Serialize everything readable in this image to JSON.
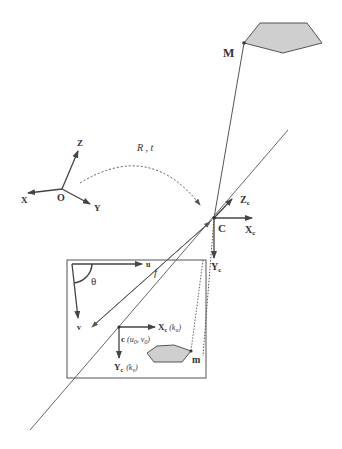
{
  "diagram": {
    "type": "pinhole-camera-model",
    "world_frame": {
      "origin_label": "O",
      "axes": [
        "X",
        "Y",
        "Z"
      ]
    },
    "transform_label": "R , t",
    "camera_center": {
      "label": "C",
      "axes": {
        "x": "X",
        "x_sub": "c",
        "y": "Y",
        "y_sub": "c",
        "z": "Z",
        "z_sub": "c"
      }
    },
    "world_point": {
      "label": "M"
    },
    "image_point": {
      "label": "m"
    },
    "focal_label": "f",
    "image_plane": {
      "u_label": "u",
      "v_label": "v",
      "skew_label": "θ",
      "principal_point_label": "c",
      "principal_point_coords": "(u",
      "u0_sub": "0",
      "comma": ", v",
      "v0_sub": "0",
      "close": ")",
      "xc_label": "X",
      "xc_sub": "c",
      "ku": "(k",
      "ku_sub": "u",
      "yc_label": "Y",
      "yc_sub": "c",
      "kv": "(k",
      "kv_sub": "v",
      "paren_close": ")"
    },
    "colors": {
      "line": "#555555",
      "polygon_fill": "#cfcfcf",
      "polygon_stroke": "#555555"
    }
  }
}
